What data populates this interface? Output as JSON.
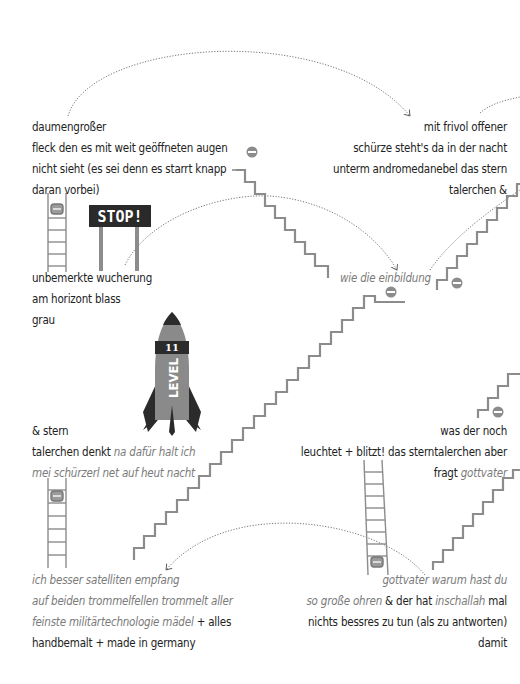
{
  "poem": {
    "block1": {
      "lines": [
        [
          {
            "t": "daumengroßer",
            "i": false
          }
        ],
        [
          {
            "t": "fleck den es mit weit geöffneten augen",
            "i": false
          }
        ],
        [
          {
            "t": "nicht sieht (es sei denn es starrt knapp",
            "i": false
          }
        ],
        [
          {
            "t": "daran vorbei)",
            "i": false
          }
        ]
      ]
    },
    "block2": {
      "lines": [
        [
          {
            "t": "mit frivol offener",
            "i": false
          }
        ],
        [
          {
            "t": "schürze steht's da in der nacht",
            "i": false
          }
        ],
        [
          {
            "t": "unterm andromedanebel das stern",
            "i": false
          }
        ],
        [
          {
            "t": "talerchen &",
            "i": false
          }
        ]
      ]
    },
    "block3": {
      "lines": [
        [
          {
            "t": "unbemerkte wucherung",
            "i": false
          }
        ],
        [
          {
            "t": "am horizont blass",
            "i": false
          }
        ],
        [
          {
            "t": "grau",
            "i": false
          }
        ]
      ]
    },
    "block4": {
      "lines": [
        [
          {
            "t": "wie die einbildung",
            "i": true
          }
        ]
      ]
    },
    "block5": {
      "lines": [
        [
          {
            "t": "& stern",
            "i": false
          }
        ],
        [
          {
            "t": "talerchen denkt ",
            "i": false
          },
          {
            "t": "na dafür halt ich",
            "i": true
          }
        ],
        [
          {
            "t": "mei schürzerl net auf heut nacht",
            "i": true
          }
        ]
      ]
    },
    "block6": {
      "lines": [
        [
          {
            "t": "was der noch",
            "i": false
          }
        ],
        [
          {
            "t": "leuchtet + blitzt! das sterntalerchen aber",
            "i": false
          }
        ],
        [
          {
            "t": "fragt ",
            "i": false
          },
          {
            "t": "gottvater",
            "i": true
          }
        ]
      ]
    },
    "block7": {
      "lines": [
        [
          {
            "t": "ich besser satelliten empfang",
            "i": true
          }
        ],
        [
          {
            "t": "auf beiden trommelfellen trommelt aller",
            "i": true
          }
        ],
        [
          {
            "t": "feinste militärtechnologie mädel",
            "i": true
          },
          {
            "t": " + alles",
            "i": false
          }
        ],
        [
          {
            "t": "handbemalt + made in germany",
            "i": false
          }
        ]
      ]
    },
    "block8": {
      "lines": [
        [
          {
            "t": "gottvater warum hast du",
            "i": true
          }
        ],
        [
          {
            "t": "so große ohren",
            "i": true
          },
          {
            "t": " & der hat ",
            "i": false
          },
          {
            "t": "inschallah",
            "i": true
          },
          {
            "t": " mal",
            "i": false
          }
        ],
        [
          {
            "t": "nichts bessres zu tun (als zu antworten)",
            "i": false
          }
        ],
        [
          {
            "t": "damit",
            "i": false
          }
        ]
      ]
    }
  },
  "signs": {
    "stop": "STOP!",
    "rocket_level_label": "LEVEL",
    "rocket_level_number": "11"
  },
  "colors": {
    "text": "#222222",
    "italic_text": "#7a7a7a",
    "stairs": "#8c8c8c",
    "sign_bg": "#2a2a2a",
    "rocket_body": "#8a8a8a",
    "rocket_dark": "#2b2b2b"
  }
}
